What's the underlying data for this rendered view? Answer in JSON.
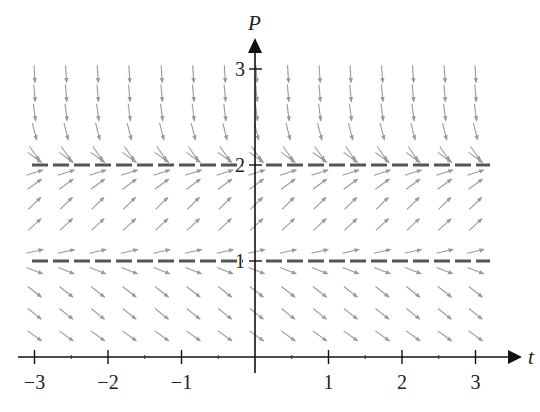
{
  "chart_data": {
    "type": "slope-field",
    "title": "",
    "xlabel": "t",
    "ylabel": "P",
    "xlim": [
      -3.3,
      3.5
    ],
    "ylim": [
      0,
      3.3
    ],
    "x_ticks": [
      -3,
      -2,
      -1,
      1,
      2,
      3
    ],
    "x_tick_labels": [
      "−3",
      "−2",
      "−1",
      "1",
      "2",
      "3"
    ],
    "y_ticks": [
      1,
      2,
      3
    ],
    "y_tick_labels": [
      "1",
      "2",
      "3"
    ],
    "grid": false,
    "equilibrium_solutions": [
      {
        "P": 1,
        "style": "dashed",
        "color": "#555555",
        "label": "P = 1"
      },
      {
        "P": 2,
        "style": "dashed",
        "color": "#555555",
        "label": "P = 2"
      }
    ],
    "field_columns_t": [
      -3.0,
      -2.57,
      -2.14,
      -1.71,
      -1.27,
      -0.84,
      -0.41,
      0.02,
      0.45,
      0.88,
      1.3,
      1.73,
      2.15,
      2.58,
      3.0
    ],
    "field_rows": [
      {
        "P": 2.95,
        "dPdt": -12.0
      },
      {
        "P": 2.75,
        "dPdt": -9.0
      },
      {
        "P": 2.55,
        "dPdt": -6.0
      },
      {
        "P": 2.35,
        "dPdt": -3.0
      },
      {
        "P": 2.12,
        "dPdt": -1.1
      },
      {
        "P": 2.08,
        "dPdt": -0.55
      },
      {
        "P": 1.92,
        "dPdt": 0.25
      },
      {
        "P": 1.8,
        "dPdt": 0.55
      },
      {
        "P": 1.6,
        "dPdt": 0.75
      },
      {
        "P": 1.38,
        "dPdt": 0.7
      },
      {
        "P": 1.1,
        "dPdt": 0.18
      },
      {
        "P": 0.9,
        "dPdt": -0.3
      },
      {
        "P": 0.68,
        "dPdt": -0.6
      },
      {
        "P": 0.45,
        "dPdt": -0.62
      },
      {
        "P": 0.22,
        "dPdt": -0.55
      }
    ],
    "arrow_color": "#9a9a9a"
  },
  "labels": {
    "x_axis": "t",
    "y_axis": "P"
  }
}
